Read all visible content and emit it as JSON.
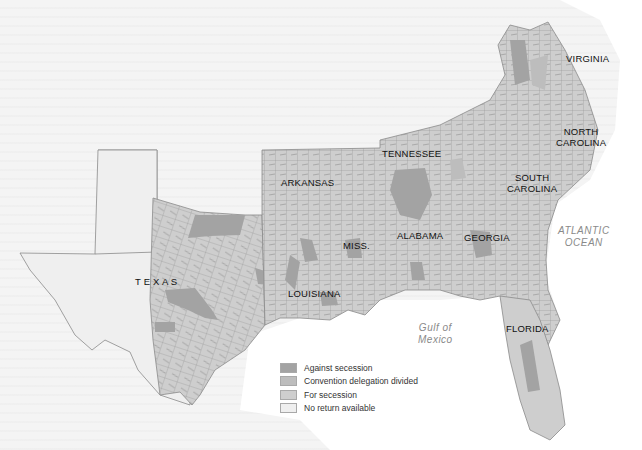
{
  "map": {
    "state_labels": [
      {
        "id": "virginia",
        "text": "VIRGINIA",
        "x": 566,
        "y": 53
      },
      {
        "id": "north-carolina",
        "text": "NORTH\nCAROLINA",
        "x": 556,
        "y": 126
      },
      {
        "id": "tennessee",
        "text": "TENNESSEE",
        "x": 382,
        "y": 148
      },
      {
        "id": "south-carolina",
        "text": "SOUTH\nCAROLINA",
        "x": 507,
        "y": 172
      },
      {
        "id": "arkansas",
        "text": "ARKANSAS",
        "x": 281,
        "y": 177
      },
      {
        "id": "miss",
        "text": "MISS.",
        "x": 343,
        "y": 240
      },
      {
        "id": "alabama",
        "text": "ALABAMA",
        "x": 397,
        "y": 230
      },
      {
        "id": "georgia",
        "text": "GEORGIA",
        "x": 464,
        "y": 232
      },
      {
        "id": "texas",
        "text": "T E X A S",
        "x": 135,
        "y": 276
      },
      {
        "id": "louisiana",
        "text": "LOUISIANA",
        "x": 288,
        "y": 288
      },
      {
        "id": "florida",
        "text": "FLORIDA",
        "x": 506,
        "y": 323
      }
    ],
    "water_labels": [
      {
        "id": "atlantic-ocean",
        "text": "ATLANTIC\nOCEAN",
        "x": 558,
        "y": 225
      },
      {
        "id": "gulf-of-mexico",
        "text": "Gulf of\nMexico",
        "x": 418,
        "y": 322
      }
    ]
  },
  "legend": {
    "items": [
      {
        "label": "Against secession",
        "color": "#a3a3a3"
      },
      {
        "label": "Convention delegation divided",
        "color": "#bdbdbd"
      },
      {
        "label": "For secession",
        "color": "#cecece"
      },
      {
        "label": "No return available",
        "color": "#efefef"
      }
    ]
  },
  "colors": {
    "background": "#f4f4f4",
    "water": "#ffffff",
    "for_secession": "#cecece",
    "against_secession": "#a3a3a3",
    "divided": "#bdbdbd",
    "no_return": "#efefef",
    "county_border": "#8c8c8c"
  }
}
